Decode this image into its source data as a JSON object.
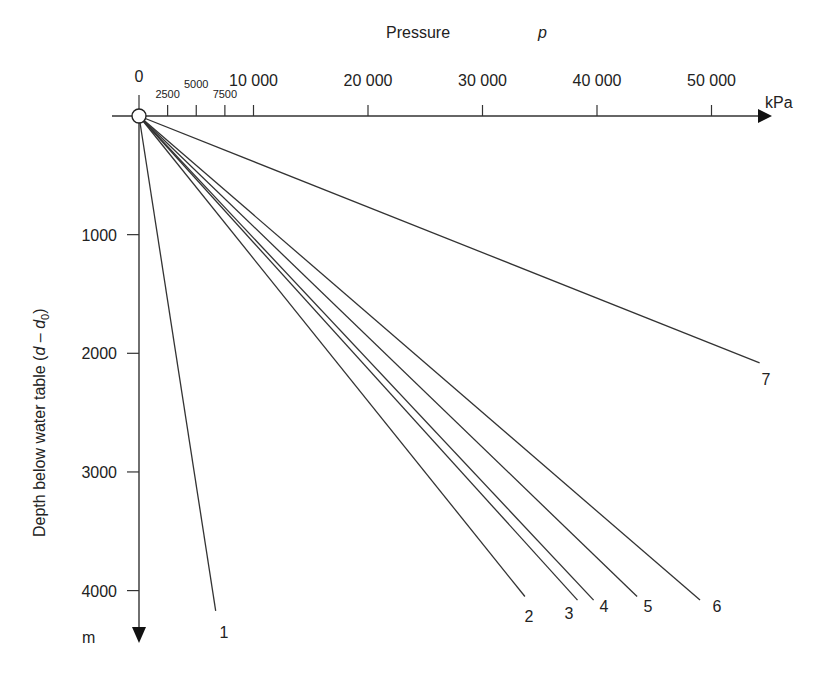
{
  "chart_data": {
    "type": "line",
    "title": "",
    "xlabel": "Pressure",
    "xlabel_symbol": "p",
    "x_unit": "kPa",
    "ylabel": "Depth below water table (d – d0)",
    "ylabel_prefix": "Depth below water table (",
    "ylabel_d": "d",
    "ylabel_dash": " – ",
    "ylabel_d0": "d",
    "ylabel_sub": "0",
    "ylabel_suffix": ")",
    "y_unit": "m",
    "xlim": [
      0,
      56000
    ],
    "ylim": [
      0,
      4300
    ],
    "x_axis_position": "top",
    "y_axis_inverted": true,
    "grid": false,
    "legend": "none (lines labelled 1–7 at their ends)",
    "x_ticks_major": [
      {
        "value": 0,
        "label": "0"
      },
      {
        "value": 10000,
        "label": "10 000"
      },
      {
        "value": 20000,
        "label": "20 000"
      },
      {
        "value": 30000,
        "label": "30 000"
      },
      {
        "value": 40000,
        "label": "40 000"
      },
      {
        "value": 50000,
        "label": "50 000"
      }
    ],
    "x_ticks_minor": [
      {
        "value": 2500,
        "label": "2500"
      },
      {
        "value": 5000,
        "label": "5000"
      },
      {
        "value": 7500,
        "label": "7500"
      }
    ],
    "y_ticks": [
      {
        "value": 1000,
        "label": "1000"
      },
      {
        "value": 2000,
        "label": "2000"
      },
      {
        "value": 3000,
        "label": "3000"
      },
      {
        "value": 4000,
        "label": "4000"
      }
    ],
    "series": [
      {
        "name": "1",
        "points": [
          [
            0,
            0
          ],
          [
            6700,
            4170
          ]
        ]
      },
      {
        "name": "2",
        "points": [
          [
            0,
            0
          ],
          [
            33700,
            4050
          ]
        ]
      },
      {
        "name": "3",
        "points": [
          [
            0,
            0
          ],
          [
            38300,
            4080
          ]
        ]
      },
      {
        "name": "4",
        "points": [
          [
            0,
            0
          ],
          [
            39700,
            4080
          ]
        ]
      },
      {
        "name": "5",
        "points": [
          [
            0,
            0
          ],
          [
            43500,
            4050
          ]
        ]
      },
      {
        "name": "6",
        "points": [
          [
            0,
            0
          ],
          [
            49000,
            4080
          ]
        ]
      },
      {
        "name": "7",
        "points": [
          [
            0,
            0
          ],
          [
            54200,
            2080
          ]
        ]
      }
    ],
    "origin_marker": "open circle at (0, 0)"
  },
  "layout": {
    "origin_px": [
      139,
      116
    ],
    "px_per_kpa": 0.01145,
    "px_per_m": 0.11865,
    "label_offsets": {
      "1": [
        224,
        638
      ],
      "2": [
        529,
        622
      ],
      "3": [
        569,
        619
      ],
      "4": [
        604,
        612
      ],
      "5": [
        648,
        612
      ],
      "6": [
        717,
        612
      ],
      "7": [
        766,
        385
      ]
    }
  }
}
